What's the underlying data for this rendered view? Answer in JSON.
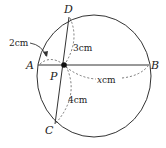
{
  "diagram": {
    "points": {
      "A": {
        "label": "A",
        "x": 38,
        "y": 65
      },
      "B": {
        "label": "B",
        "x": 149,
        "y": 65
      },
      "C": {
        "label": "C",
        "x": 55,
        "y": 124
      },
      "D": {
        "label": "D",
        "x": 69,
        "y": 17
      },
      "P": {
        "label": "P",
        "x": 64,
        "y": 65
      }
    },
    "circle": {
      "cx": 94,
      "cy": 76,
      "rx": 57,
      "ry": 61
    },
    "segments": [
      {
        "from": "A",
        "to": "B",
        "style": "solid"
      },
      {
        "from": "C",
        "to": "D",
        "style": "solid"
      }
    ],
    "measurements": {
      "AP": "2cm",
      "PD": "3cm",
      "PC": "4cm",
      "PB": "xcm"
    },
    "labels": {
      "A": "A",
      "B": "B",
      "C": "C",
      "D": "D",
      "P": "P",
      "ap": "2cm",
      "pd": "3cm",
      "pc": "4cm",
      "pb_var": "x",
      "pb_unit": "cm"
    },
    "colors": {
      "stroke": "#333333",
      "dash": "#555555"
    }
  }
}
